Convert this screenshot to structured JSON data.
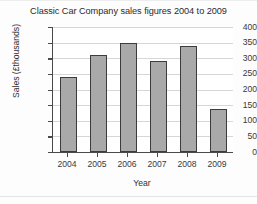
{
  "chart_data": {
    "type": "bar",
    "title": "Classic Car Company sales figures 2004 to 2009",
    "xlabel": "Year",
    "ylabel": "Sales (£thousands)",
    "categories": [
      "2004",
      "2005",
      "2006",
      "2007",
      "2008",
      "2009"
    ],
    "values": [
      240,
      310,
      350,
      290,
      340,
      137
    ],
    "ylim": [
      0,
      400
    ],
    "ytick_labels": [
      "0",
      "50",
      "100",
      "150",
      "200",
      "250",
      "300",
      "350",
      "400"
    ],
    "ytick_values": [
      0,
      50,
      100,
      150,
      200,
      250,
      300,
      350,
      400
    ],
    "ytick_step": 50,
    "grid": true,
    "grid_axis": "y",
    "legend": false,
    "bar_color": "#a9a9a9",
    "bar_edge_color": "#3c3c3c",
    "grid_color": "#d6d6d6",
    "axis_color": "#4a4a4a",
    "background_color": "#ffffff"
  }
}
